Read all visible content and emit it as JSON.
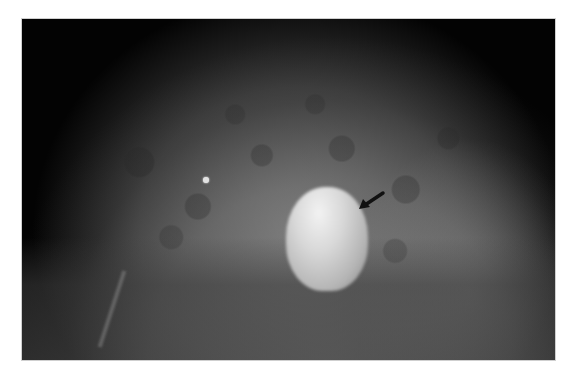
{
  "image": {
    "type": "mammogram",
    "description": "X-ray mammogram showing dense breast tissue with a bright oval mass indicated by a black arrow and a small round calcification on the left",
    "annotations": [
      {
        "type": "arrow",
        "direction": "down-left",
        "points_to": "oval mass"
      }
    ],
    "colors": {
      "background": "#ffffff",
      "frame": "#030303",
      "arrow": "#111111"
    }
  }
}
